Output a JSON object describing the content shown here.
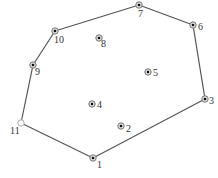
{
  "diagram": {
    "type": "convex-hull",
    "colors": {
      "hull_edge": "#555555",
      "point_ring": "#777777",
      "point_center": "#111111",
      "start_point_ring": "#aaaaaa",
      "label": "#333333",
      "background": "#ffffff"
    },
    "points": [
      {
        "id": "1",
        "label": "1",
        "x": 93,
        "y": 158,
        "lx": 97,
        "ly": 168,
        "on_hull": true,
        "hollow": false
      },
      {
        "id": "2",
        "label": "2",
        "x": 121,
        "y": 126,
        "lx": 126,
        "ly": 132,
        "on_hull": false,
        "hollow": false
      },
      {
        "id": "3",
        "label": "3",
        "x": 205,
        "y": 99,
        "lx": 209,
        "ly": 104,
        "on_hull": true,
        "hollow": false
      },
      {
        "id": "4",
        "label": "4",
        "x": 92,
        "y": 104,
        "lx": 97,
        "ly": 108,
        "on_hull": false,
        "hollow": false
      },
      {
        "id": "5",
        "label": "5",
        "x": 148,
        "y": 72,
        "lx": 153,
        "ly": 76,
        "on_hull": false,
        "hollow": false
      },
      {
        "id": "6",
        "label": "6",
        "x": 193,
        "y": 25,
        "lx": 198,
        "ly": 30,
        "on_hull": true,
        "hollow": false
      },
      {
        "id": "7",
        "label": "7",
        "x": 139,
        "y": 5,
        "lx": 138,
        "ly": 17,
        "on_hull": true,
        "hollow": false
      },
      {
        "id": "8",
        "label": "8",
        "x": 99,
        "y": 38,
        "lx": 101,
        "ly": 47,
        "on_hull": false,
        "hollow": false
      },
      {
        "id": "9",
        "label": "9",
        "x": 33,
        "y": 65,
        "lx": 35,
        "ly": 75,
        "on_hull": true,
        "hollow": false
      },
      {
        "id": "10",
        "label": "10",
        "x": 55,
        "y": 31,
        "lx": 54,
        "ly": 43,
        "on_hull": true,
        "hollow": false
      },
      {
        "id": "11",
        "label": "11",
        "x": 21,
        "y": 123,
        "lx": 10,
        "ly": 134,
        "on_hull": true,
        "hollow": true
      }
    ],
    "hull_order": [
      "11",
      "1",
      "3",
      "6",
      "7",
      "10",
      "9",
      "11"
    ]
  }
}
